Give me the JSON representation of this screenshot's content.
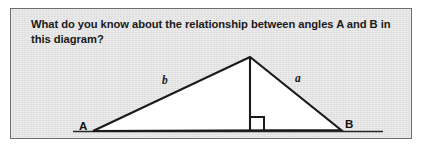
{
  "panel": {
    "background_color": "#e3e3e3",
    "border_color": "#6e6e6e"
  },
  "question": {
    "text": "What do you know about the relationship between angles A and B in this diagram?"
  },
  "diagram": {
    "type": "geometry-triangle",
    "fill_color": "#ffffff",
    "stroke_color": "#1a1a1a",
    "vertices": {
      "A": {
        "label": "A",
        "x": 92,
        "y": 122
      },
      "B": {
        "label": "B",
        "x": 340,
        "y": 121
      },
      "apex": {
        "label": "",
        "x": 249,
        "y": 48
      }
    },
    "altitude": {
      "from": "apex",
      "foot": {
        "x": 249,
        "y": 122
      },
      "right_angle_marker": true
    },
    "side_labels": [
      {
        "name": "b",
        "text": "b",
        "side": "A-to-apex"
      },
      {
        "name": "a",
        "text": "a",
        "side": "apex-to-B"
      }
    ],
    "baseline_extends_beyond_vertices": true
  }
}
